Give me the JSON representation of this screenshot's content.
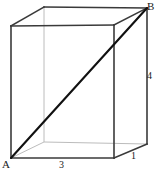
{
  "figure": {
    "kind": "rectangular-prism-space-diagonal",
    "colors": {
      "background": "#ffffff",
      "visible_edge": "#3a3a3a",
      "hidden_edge": "#bcbcbc",
      "diagonal": "#111111",
      "label_text": "#1a1a1a"
    },
    "vertices": [
      {
        "id": "A",
        "label": "A",
        "role": "front-bottom-left",
        "x": 11,
        "y": 158
      },
      {
        "id": "B",
        "label": "B",
        "role": "back-top-right",
        "x": 147,
        "y": 8
      },
      {
        "id": "C",
        "label": "",
        "role": "front-top-left",
        "x": 11,
        "y": 26
      },
      {
        "id": "D",
        "label": "",
        "role": "front-top-right",
        "x": 114,
        "y": 25
      },
      {
        "id": "E",
        "label": "",
        "role": "front-bottom-right",
        "x": 114,
        "y": 158
      },
      {
        "id": "F",
        "label": "",
        "role": "back-top-left",
        "x": 44,
        "y": 7
      },
      {
        "id": "G",
        "label": "",
        "role": "back-bottom-left",
        "x": 44,
        "y": 142
      },
      {
        "id": "H",
        "label": "",
        "role": "back-bottom-right",
        "x": 147,
        "y": 144
      }
    ],
    "visible_edges": [
      {
        "name": "front-left-vertical",
        "from": "A",
        "to": "C"
      },
      {
        "name": "front-top",
        "from": "C",
        "to": "D"
      },
      {
        "name": "front-right-vertical",
        "from": "D",
        "to": "E"
      },
      {
        "name": "front-bottom",
        "from": "E",
        "to": "A"
      },
      {
        "name": "top-left-receding",
        "from": "C",
        "to": "F"
      },
      {
        "name": "back-top",
        "from": "F",
        "to": "B"
      },
      {
        "name": "top-right-receding",
        "from": "D",
        "to": "B"
      },
      {
        "name": "back-right-vertical",
        "from": "B",
        "to": "H"
      },
      {
        "name": "bottom-right-receding",
        "from": "E",
        "to": "H"
      }
    ],
    "hidden_edges": [
      {
        "name": "back-left-vertical",
        "from": "F",
        "to": "G"
      },
      {
        "name": "back-bottom",
        "from": "G",
        "to": "H"
      },
      {
        "name": "bottom-left-receding",
        "from": "A",
        "to": "G"
      }
    ],
    "diagonal": {
      "name": "space-diagonal-AB",
      "from": "A",
      "to": "B"
    },
    "labels": {
      "vertex_a": "A",
      "vertex_b": "B",
      "length_bottom": "3",
      "length_depth": "1",
      "length_height": "4"
    },
    "dimensions": {
      "width": 3,
      "depth": 1,
      "height": 4
    }
  }
}
